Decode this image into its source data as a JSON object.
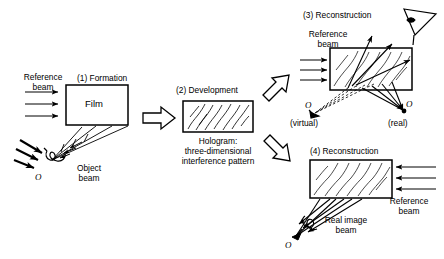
{
  "figure": {
    "line_color": "#000000",
    "fill_color": "#ffffff"
  },
  "panels": [
    {
      "id": "formation",
      "heading": "(1) Formation",
      "labels": {
        "reference_beam": "Reference\nbeam",
        "film": "Film",
        "object_beam": "Object\nbeam",
        "object_symbol": "O"
      }
    },
    {
      "id": "development",
      "heading": "(2) Development",
      "labels": {
        "caption": "Hologram:\nthree-dimensional\ninterference pattern"
      }
    },
    {
      "id": "reconstruction-virtual",
      "heading": "(3) Reconstruction",
      "labels": {
        "reference_beam": "Reference\nbeam",
        "virtual_symbol": "O",
        "virtual_note": "(virtual)",
        "real_symbol": "O",
        "real_note": "(real)"
      }
    },
    {
      "id": "reconstruction-real",
      "heading": "(4) Reconstruction",
      "labels": {
        "reference_beam": "Reference\nbeam",
        "real_image_beam": "Real image\nbeam",
        "object_symbol": "O"
      }
    }
  ],
  "icons": {
    "eye": "eye-icon",
    "block_arrow_right": "block-arrow-right-icon",
    "block_arrow_up_right": "block-arrow-up-right-icon",
    "block_arrow_down_right": "block-arrow-down-right-icon"
  }
}
